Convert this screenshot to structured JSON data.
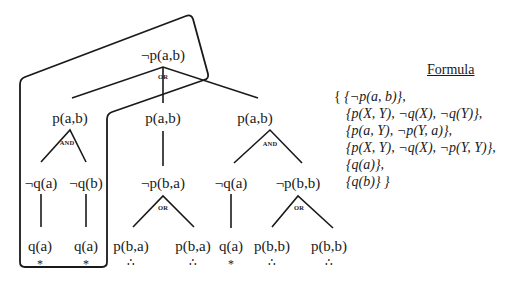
{
  "tree": {
    "root": {
      "label": "¬p(a,b)",
      "connective": "OR"
    },
    "level2": [
      {
        "label": "p(a,b)",
        "connective": "AND"
      },
      {
        "label": "p(a,b)",
        "connective": ""
      },
      {
        "label": "p(a,b)",
        "connective": "AND"
      }
    ],
    "level3": [
      {
        "label": "¬q(a)"
      },
      {
        "label": "¬q(b)"
      },
      {
        "label": "¬p(b,a)",
        "connective": "OR"
      },
      {
        "label": "¬q(a)"
      },
      {
        "label": "¬p(b,b)",
        "connective": "OR"
      }
    ],
    "leaves": [
      {
        "label": "q(a)",
        "marker": "*"
      },
      {
        "label": "q(a)",
        "marker": "*"
      },
      {
        "label": "p(b,a)",
        "marker": "∴"
      },
      {
        "label": "p(b,a)",
        "marker": "∴"
      },
      {
        "label": "q(a)",
        "marker": "*"
      },
      {
        "label": "p(b,b)",
        "marker": "∴"
      },
      {
        "label": "p(b,b)",
        "marker": "∴"
      }
    ]
  },
  "formula": {
    "title": "Formula",
    "open_brace": "{ ",
    "clauses": [
      "{¬p(a, b)},",
      "{p(X, Y), ¬q(X), ¬q(Y)},",
      "{p(a, Y), ¬p(Y, a)},",
      "{p(X, Y), ¬q(X), ¬p(Y, Y)},",
      "{q(a)},",
      "{q(b)} }"
    ]
  }
}
